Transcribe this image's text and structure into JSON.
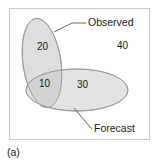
{
  "figure": {
    "caption": "(a)",
    "frame_color": "#c9c9c9",
    "background_color": "#ffffff"
  },
  "diagram": {
    "type": "venn",
    "set_fill_color": "#dedede",
    "set_stroke_color": "#9a9a9a",
    "overlap_fill_color": "#d2d2d2",
    "sets": [
      {
        "id": "observed",
        "label": "Observed",
        "shape": "ellipse",
        "cx": 32,
        "cy": 54,
        "rx": 19,
        "ry": 45,
        "rotate": -8,
        "leader_from_x": 44,
        "leader_from_y": 23,
        "leader_mid_x": 62,
        "leader_mid_y": 14,
        "leader_to_x": 76,
        "leader_to_y": 14,
        "label_x": 78,
        "label_y": 17
      },
      {
        "id": "forecast",
        "label": "Forecast",
        "shape": "ellipse",
        "cx": 67,
        "cy": 81,
        "rx": 51,
        "ry": 21,
        "rotate": 0,
        "leader_from_x": 64,
        "leader_from_y": 99,
        "leader_mid_x": 80,
        "leader_mid_y": 118,
        "leader_to_x": 82,
        "leader_to_y": 120,
        "label_x": 84,
        "label_y": 123
      }
    ],
    "counts": [
      {
        "id": "observed-only",
        "value": "20",
        "x": 27,
        "y": 41
      },
      {
        "id": "intersection",
        "value": "10",
        "x": 29,
        "y": 78
      },
      {
        "id": "forecast-only",
        "value": "30",
        "x": 67,
        "y": 79
      },
      {
        "id": "neither",
        "value": "40",
        "x": 107,
        "y": 40
      }
    ]
  }
}
